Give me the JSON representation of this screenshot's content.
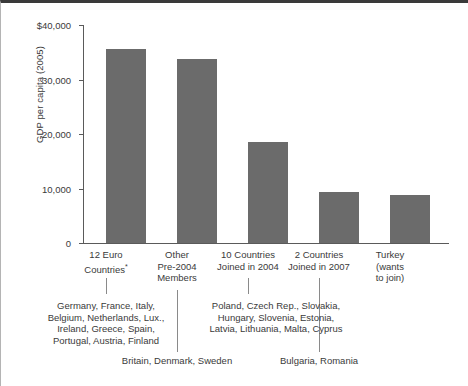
{
  "chart_data": {
    "type": "bar",
    "title": "",
    "subtitle": "",
    "xlabel": "",
    "ylabel": "GDP per capita (2005)",
    "ylim": [
      0,
      40000
    ],
    "yticks": [
      0,
      10000,
      20000,
      30000,
      40000
    ],
    "ytick_labels": [
      "0",
      "10,000",
      "20,000",
      "30,000",
      "$40,000"
    ],
    "grid": false,
    "legend": "none",
    "bar_color": "#6b6b6b",
    "categories": [
      "12 Euro Countries*",
      "Other Pre-2004 Members",
      "10 Countries Joined in 2004",
      "2 Countries Joined in 2007",
      "Turkey (wants to join)"
    ],
    "values": [
      35600,
      33700,
      18500,
      9400,
      8800
    ],
    "annotations": [
      "Germany, France, Italy, Belgium, Netherlands, Lux., Ireland, Greece, Spain, Portugal, Austria, Finland",
      "Britain, Denmark, Sweden",
      "Poland, Czech Rep., Slovakia, Hungary, Slovenia, Estonia, Latvia, Lithuania, Malta, Cyprus",
      "Bulgaria, Romania"
    ]
  },
  "axis": {
    "y_title": "GDP per capita (2005)",
    "y_ticks": [
      {
        "label": "$40,000",
        "value": 40000
      },
      {
        "label": "30,000",
        "value": 30000
      },
      {
        "label": "20,000",
        "value": 20000
      },
      {
        "label": "10,000",
        "value": 10000
      },
      {
        "label": "0",
        "value": 0
      }
    ]
  },
  "categories": [
    {
      "line1": "12 Euro",
      "line2": "Countries",
      "asterisk": "*",
      "line3": "",
      "value": 35600
    },
    {
      "line1": "Other",
      "line2": "Pre-2004",
      "asterisk": "",
      "line3": "Members",
      "value": 33700
    },
    {
      "line1": "10 Countries",
      "line2": "Joined in 2004",
      "asterisk": "",
      "line3": "",
      "value": 18500
    },
    {
      "line1": "2 Countries",
      "line2": "Joined in 2007",
      "asterisk": "",
      "line3": "",
      "value": 9400
    },
    {
      "line1": "Turkey",
      "line2": "(wants",
      "asterisk": "",
      "line3": "to join)",
      "value": 8800
    }
  ],
  "notes": {
    "euro12": {
      "l1": "Germany, France, Italy,",
      "l2": "Belgium, Netherlands, Lux.,",
      "l3": "Ireland, Greece, Spain,",
      "l4": "Portugal, Austria, Finland"
    },
    "other_pre2004": {
      "l1": "Britain, Denmark, Sweden"
    },
    "joined2004": {
      "l1": "Poland, Czech Rep., Slovakia,",
      "l2": "Hungary, Slovenia, Estonia,",
      "l3": "Latvia, Lithuania, Malta, Cyprus"
    },
    "joined2007": {
      "l1": "Bulgaria, Romania"
    }
  }
}
